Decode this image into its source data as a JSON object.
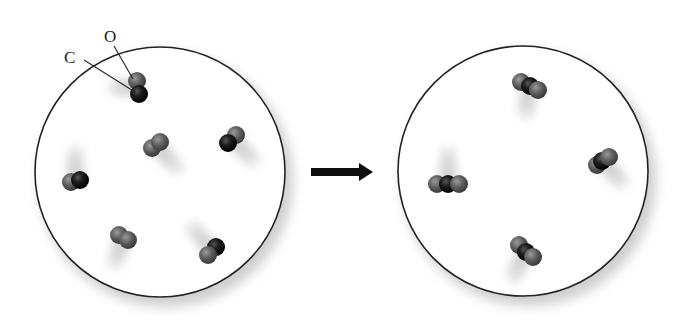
{
  "diagram": {
    "colors": {
      "carbon": "#141414",
      "oxygen": "#5e5e5e",
      "outline": "#222222",
      "arrow": "#0d0d0d",
      "background": "#ffffff"
    },
    "labels": [
      {
        "id": "carbon-label",
        "text": "C",
        "x": 64,
        "y": 63,
        "leader": [
          [
            84,
            60
          ],
          [
            135,
            92
          ]
        ]
      },
      {
        "id": "oxygen-label",
        "text": "O",
        "x": 104,
        "y": 42,
        "leader": [
          [
            114,
            46
          ],
          [
            133,
            79
          ]
        ]
      }
    ],
    "before": {
      "name": "reactants-container",
      "cx": 160,
      "cy": 172,
      "r": 125,
      "molecules": [
        {
          "type": "CO",
          "atoms": [
            {
              "el": "O",
              "x": 137,
              "y": 81
            },
            {
              "el": "C",
              "x": 139,
              "y": 94
            }
          ],
          "trail": {
            "dx": -22,
            "dy": 0
          }
        },
        {
          "type": "O2",
          "atoms": [
            {
              "el": "O",
              "x": 152,
              "y": 148
            },
            {
              "el": "O",
              "x": 160,
              "y": 142
            }
          ],
          "trail": {
            "dx": 20,
            "dy": 22
          }
        },
        {
          "type": "CO",
          "atoms": [
            {
              "el": "O",
              "x": 236,
              "y": 135
            },
            {
              "el": "C",
              "x": 228,
              "y": 143
            }
          ],
          "trail": {
            "dx": 20,
            "dy": 20
          }
        },
        {
          "type": "CO",
          "atoms": [
            {
              "el": "O",
              "x": 71,
              "y": 182
            },
            {
              "el": "C",
              "x": 80,
              "y": 180
            }
          ],
          "trail": {
            "dx": 0,
            "dy": -28
          }
        },
        {
          "type": "O2",
          "atoms": [
            {
              "el": "O",
              "x": 119,
              "y": 235
            },
            {
              "el": "O",
              "x": 128,
              "y": 240
            }
          ],
          "trail": {
            "dx": -8,
            "dy": 24
          }
        },
        {
          "type": "CO",
          "atoms": [
            {
              "el": "C",
              "x": 216,
              "y": 247
            },
            {
              "el": "O",
              "x": 208,
              "y": 255
            }
          ],
          "trail": {
            "dx": -18,
            "dy": -22
          }
        }
      ]
    },
    "arrow": {
      "x1": 311,
      "x2": 373,
      "y": 172,
      "label": "reaction-arrow"
    },
    "after": {
      "name": "products-container",
      "cx": 523,
      "cy": 171,
      "r": 125,
      "molecules": [
        {
          "type": "CO2",
          "atoms": [
            {
              "el": "O",
              "x": 521,
              "y": 82
            },
            {
              "el": "C",
              "x": 530,
              "y": 86
            },
            {
              "el": "O",
              "x": 538,
              "y": 90
            }
          ],
          "trail": {
            "dx": -4,
            "dy": 26
          }
        },
        {
          "type": "CO2",
          "atoms": [
            {
              "el": "O",
              "x": 437,
              "y": 184
            },
            {
              "el": "C",
              "x": 448,
              "y": 184
            },
            {
              "el": "O",
              "x": 459,
              "y": 184
            }
          ],
          "trail": {
            "dx": 0,
            "dy": -30
          }
        },
        {
          "type": "CO2",
          "atoms": [
            {
              "el": "O",
              "x": 597,
              "y": 165
            },
            {
              "el": "C",
              "x": 602,
              "y": 161
            },
            {
              "el": "O",
              "x": 609,
              "y": 157
            }
          ],
          "trail": {
            "dx": 18,
            "dy": 20
          }
        },
        {
          "type": "CO2",
          "atoms": [
            {
              "el": "O",
              "x": 519,
              "y": 245
            },
            {
              "el": "C",
              "x": 526,
              "y": 252
            },
            {
              "el": "O",
              "x": 533,
              "y": 257
            }
          ],
          "trail": {
            "dx": -12,
            "dy": 24
          }
        }
      ]
    }
  }
}
